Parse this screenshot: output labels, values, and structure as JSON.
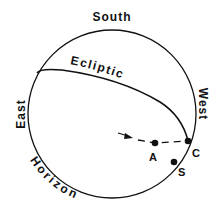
{
  "diagram": {
    "labels": {
      "south": "South",
      "east": "East",
      "west": "West",
      "horizon": "Horizon",
      "ecliptic": "Ecliptic",
      "point_a": "A",
      "point_c": "C",
      "point_s": "S"
    },
    "colors": {
      "ink": "#111111",
      "background": "#ffffff"
    }
  }
}
